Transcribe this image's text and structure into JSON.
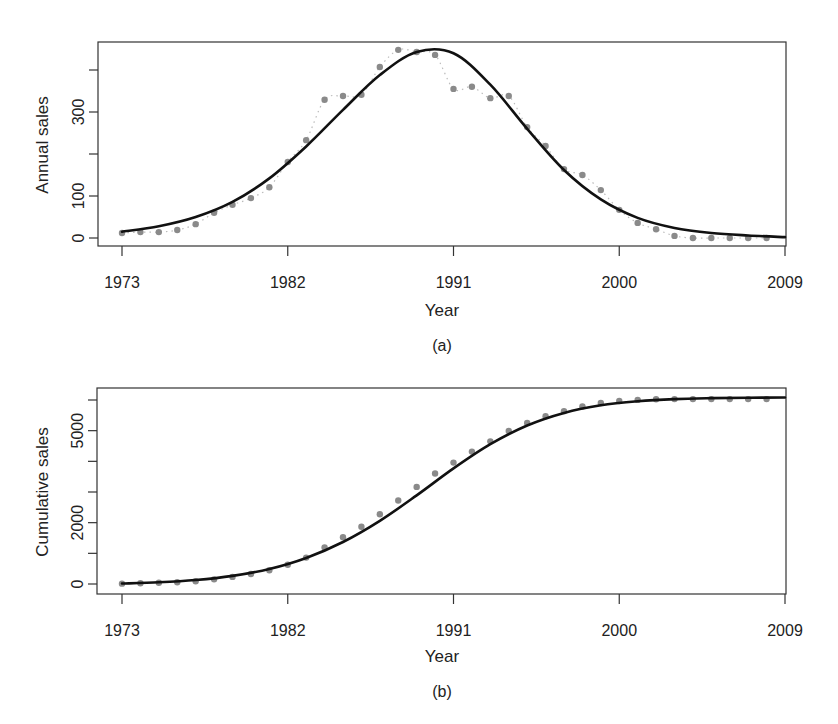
{
  "chart_data": [
    {
      "type": "line",
      "panel_label": "(a)",
      "xlabel": "Year",
      "ylabel": "Annual sales",
      "x_ticks": [
        1973,
        1982,
        1991,
        2000,
        2009
      ],
      "y_ticks": [
        0,
        100,
        200,
        300,
        400
      ],
      "y_tick_labels": [
        "0",
        "100",
        "",
        "300",
        ""
      ],
      "xlim": [
        1971.7,
        2009.2
      ],
      "ylim": [
        -20,
        460
      ],
      "grid": false,
      "series": [
        {
          "name": "Observed annual sales",
          "style": "points+dotted",
          "color": "#8a8a8a",
          "x": [
            1973,
            1974,
            1975,
            1976,
            1977,
            1978,
            1979,
            1980,
            1981,
            1982,
            1983,
            1984,
            1985,
            1986,
            1987,
            1988,
            1989,
            1990,
            1991,
            1992,
            1993,
            1994,
            1995,
            1996,
            1997,
            1998,
            1999,
            2000,
            2001,
            2002,
            2003,
            2004,
            2005,
            2006,
            2007,
            2008
          ],
          "values": [
            12,
            14,
            14,
            19,
            33,
            60,
            79,
            95,
            121,
            181,
            233,
            329,
            338,
            341,
            407,
            448,
            443,
            436,
            355,
            360,
            333,
            338,
            264,
            219,
            164,
            150,
            114,
            67,
            36,
            21,
            5,
            0,
            0,
            0,
            0,
            0
          ]
        },
        {
          "name": "Fitted curve",
          "style": "solid",
          "color": "#111111",
          "model": "bell",
          "peak_year": 1989.2,
          "peak_value": 455,
          "x": [
            1973,
            1975,
            1977,
            1979,
            1981,
            1983,
            1985,
            1987,
            1989,
            1991,
            1993,
            1995,
            1997,
            1999,
            2001,
            2003,
            2005,
            2007,
            2009
          ],
          "values": [
            15,
            28,
            50,
            86,
            142,
            218,
            305,
            388,
            443,
            440,
            365,
            260,
            162,
            92,
            48,
            24,
            12,
            6,
            2
          ]
        }
      ]
    },
    {
      "type": "line",
      "panel_label": "(b)",
      "xlabel": "Year",
      "ylabel": "Cumulative sales",
      "x_ticks": [
        1973,
        1982,
        1991,
        2000,
        2009
      ],
      "y_ticks": [
        0,
        1000,
        2000,
        3000,
        4000,
        5000,
        6000
      ],
      "y_tick_labels": [
        "0",
        "",
        "2000",
        "",
        "",
        "5000",
        ""
      ],
      "xlim": [
        1971.7,
        2009.2
      ],
      "ylim": [
        -250,
        6400
      ],
      "grid": false,
      "series": [
        {
          "name": "Observed cumulative sales",
          "style": "points",
          "color": "#8a8a8a",
          "x": [
            1973,
            1974,
            1975,
            1976,
            1977,
            1978,
            1979,
            1980,
            1981,
            1982,
            1983,
            1984,
            1985,
            1986,
            1987,
            1988,
            1989,
            1990,
            1991,
            1992,
            1993,
            1994,
            1995,
            1996,
            1997,
            1998,
            1999,
            2000,
            2001,
            2002,
            2003,
            2004,
            2005,
            2006,
            2007,
            2008
          ],
          "values": [
            12,
            26,
            40,
            59,
            92,
            152,
            231,
            326,
            447,
            628,
            861,
            1190,
            1528,
            1869,
            2276,
            2724,
            3167,
            3603,
            3958,
            4318,
            4651,
            4989,
            5253,
            5472,
            5636,
            5786,
            5900,
            5967,
            6003,
            6024,
            6029,
            6029,
            6029,
            6029,
            6029,
            6029
          ]
        },
        {
          "name": "Fitted cumulative curve",
          "style": "solid",
          "color": "#111111",
          "x": [
            1973,
            1975,
            1977,
            1979,
            1981,
            1983,
            1985,
            1987,
            1989,
            1991,
            1993,
            1995,
            1997,
            1999,
            2001,
            2003,
            2005,
            2007,
            2009
          ],
          "values": [
            15,
            55,
            130,
            265,
            490,
            850,
            1370,
            2060,
            2890,
            3770,
            4560,
            5170,
            5580,
            5830,
            5960,
            6030,
            6060,
            6075,
            6080
          ]
        }
      ]
    }
  ]
}
